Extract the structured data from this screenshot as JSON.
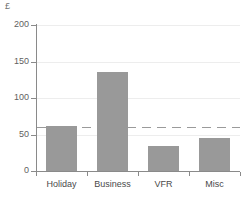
{
  "chart_data": {
    "type": "bar",
    "title": "",
    "subtitle": "",
    "xlabel": "",
    "ylabel": "£",
    "unit_symbol": "£",
    "categories": [
      "Holiday",
      "Business",
      "VFR",
      "Misc"
    ],
    "values": [
      62,
      135,
      34,
      45
    ],
    "series": [
      {
        "name": "Average spend",
        "values": [
          62,
          135,
          34,
          45
        ]
      }
    ],
    "ylim": [
      0,
      200
    ],
    "yticks": [
      0,
      50,
      100,
      150,
      200
    ],
    "ytick_labels": [
      "0",
      "50",
      "100",
      "150",
      "200"
    ],
    "grid": true,
    "grid_axis": "y",
    "legend": false,
    "legend_position": "none",
    "annotations": [
      {
        "type": "reference-line",
        "orientation": "horizontal",
        "value": 60,
        "style": "dashed"
      }
    ],
    "bar_color": "#999999",
    "axis_color": "#8a8a8a",
    "grid_color": "#ededed",
    "reference_line_color": "#9a9a9a",
    "background_color": "#ffffff"
  }
}
